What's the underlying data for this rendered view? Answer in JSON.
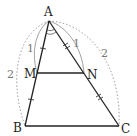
{
  "figure": {
    "points": {
      "A": {
        "label": "A",
        "x": 49,
        "y": 21
      },
      "B": {
        "label": "B",
        "x": 25,
        "y": 126
      },
      "C": {
        "label": "C",
        "x": 119,
        "y": 126
      },
      "M": {
        "label": "M",
        "x": 37,
        "y": 73
      },
      "N": {
        "label": "N",
        "x": 84,
        "y": 73
      }
    },
    "segments": [
      {
        "name": "AB",
        "from": "A",
        "to": "B"
      },
      {
        "name": "AC",
        "from": "A",
        "to": "C"
      },
      {
        "name": "BC",
        "from": "B",
        "to": "C"
      },
      {
        "name": "MN",
        "from": "M",
        "to": "N"
      }
    ],
    "length_labels": {
      "AM": "1",
      "AB": "2",
      "AN": "1",
      "AC": "2"
    },
    "tick_marks": {
      "AM": 1,
      "MB": 1,
      "AN": 2,
      "NC": 2
    },
    "angle_mark_at": "A",
    "colors": {
      "line": "#222222",
      "arc_solid": "#888888",
      "arc_dotted": "#9a9a9a",
      "label": "#222222",
      "length_label": "#777777"
    }
  }
}
